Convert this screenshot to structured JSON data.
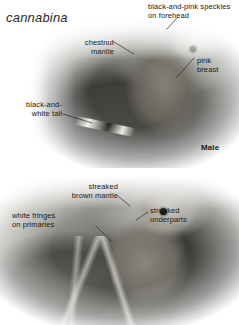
{
  "plate": {
    "species_name": "cannabina",
    "subject": "linnet",
    "background_color": "#ffffff",
    "text_color": "#1a1a1a"
  },
  "upper_photo": {
    "caption": "Male",
    "annotations": [
      {
        "id": "forehead",
        "text": "black-and-pink speckles\non forehead",
        "align": "left",
        "x": 148,
        "y": 2
      },
      {
        "id": "mantle",
        "text": "chestnut\nmantle",
        "align": "right",
        "x": 60,
        "y": 38
      },
      {
        "id": "breast",
        "text": "pink\nbreast",
        "align": "left",
        "x": 197,
        "y": 56
      },
      {
        "id": "tail",
        "text": "black-and-\nwhite tail",
        "align": "right",
        "x": 8,
        "y": 100
      }
    ],
    "leaders": [
      {
        "id": "forehead-leader",
        "x1": 177,
        "y1": 18,
        "x2": 167,
        "y2": 29
      },
      {
        "id": "mantle-leader",
        "x1": 114,
        "y1": 42,
        "x2": 134,
        "y2": 54
      },
      {
        "id": "breast-leader",
        "x1": 194,
        "y1": 58,
        "x2": 176,
        "y2": 78
      },
      {
        "id": "tail-leader",
        "x1": 63,
        "y1": 114,
        "x2": 92,
        "y2": 123
      }
    ]
  },
  "lower_photo": {
    "caption": "",
    "annotations": [
      {
        "id": "brown-mantle",
        "text": "streaked\nbrown mantle",
        "align": "right",
        "x": 47,
        "y": 182
      },
      {
        "id": "primaries",
        "text": "white fringes\non primaries",
        "align": "left",
        "x": 12,
        "y": 211
      },
      {
        "id": "underparts",
        "text": "streaked\nunderparts",
        "align": "left",
        "x": 150,
        "y": 206
      }
    ],
    "leaders": [
      {
        "id": "brown-mantle-leader",
        "x1": 118,
        "y1": 196,
        "x2": 130,
        "y2": 206
      },
      {
        "id": "primaries-leader",
        "x1": 96,
        "y1": 226,
        "x2": 111,
        "y2": 241
      },
      {
        "id": "underparts-leader",
        "x1": 148,
        "y1": 212,
        "x2": 136,
        "y2": 220
      }
    ]
  },
  "male_label": {
    "text": "Male",
    "x": 201,
    "y": 143
  }
}
